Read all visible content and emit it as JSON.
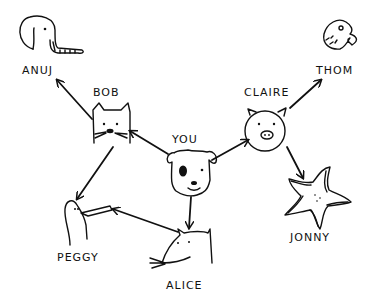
{
  "diagram": {
    "type": "directed-graph",
    "nodes": [
      {
        "id": "you",
        "label": "YOU",
        "animal": "dog"
      },
      {
        "id": "bob",
        "label": "BOB",
        "animal": "cat"
      },
      {
        "id": "claire",
        "label": "CLAIRE",
        "animal": "pig"
      },
      {
        "id": "alice",
        "label": "ALICE",
        "animal": "rat"
      },
      {
        "id": "anuj",
        "label": "ANUJ",
        "animal": "elephant"
      },
      {
        "id": "peggy",
        "label": "PEGGY",
        "animal": "bird"
      },
      {
        "id": "thom",
        "label": "THOM",
        "animal": "fish"
      },
      {
        "id": "jonny",
        "label": "JONNY",
        "animal": "starfish"
      }
    ],
    "edges": [
      {
        "from": "you",
        "to": "bob"
      },
      {
        "from": "you",
        "to": "claire"
      },
      {
        "from": "you",
        "to": "alice"
      },
      {
        "from": "bob",
        "to": "anuj"
      },
      {
        "from": "bob",
        "to": "peggy"
      },
      {
        "from": "alice",
        "to": "peggy"
      },
      {
        "from": "claire",
        "to": "thom"
      },
      {
        "from": "claire",
        "to": "jonny"
      }
    ]
  },
  "labels": {
    "you": "YOU",
    "bob": "BOB",
    "claire": "CLAIRE",
    "alice": "ALICE",
    "anuj": "ANUJ",
    "peggy": "PEGGY",
    "thom": "THOM",
    "jonny": "JONNY"
  }
}
